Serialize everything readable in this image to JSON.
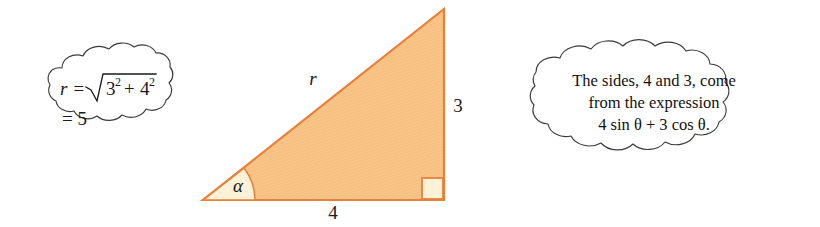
{
  "figure": {
    "background_color": "#ffffff",
    "triangle": {
      "fill_color": "#f8c487",
      "stroke_color": "#e8803a",
      "accent_fill_color": "#fdf2d8",
      "vertices": {
        "bottom_left": [
          203,
          200
        ],
        "bottom_right": [
          444,
          200
        ],
        "top_right": [
          444,
          9
        ]
      },
      "labels": {
        "hypotenuse": "r",
        "vertical_side": "3",
        "horizontal_side": "4",
        "angle": "α"
      },
      "right_angle_marker": true
    },
    "left_cloud": {
      "name": "magnitude-computation-cloud",
      "line1": {
        "lead": "r =",
        "radicand_first_base": "3",
        "radicand_first_exp": "2",
        "operator": "+",
        "radicand_second_base": "4",
        "radicand_second_exp": "2"
      },
      "line2": "= 5"
    },
    "right_cloud": {
      "name": "expression-explanation-cloud",
      "lines": [
        "The sides, 4 and 3, come",
        "from the expression",
        "4 sin θ + 3 cos θ."
      ]
    }
  }
}
